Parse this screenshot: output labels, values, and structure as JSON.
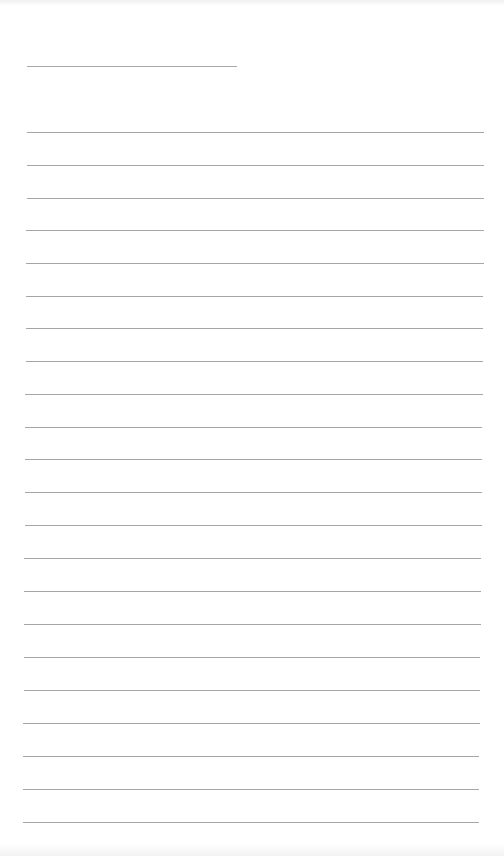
{
  "page": {
    "type": "lined-paper",
    "background_color": "#ffffff",
    "line_color": "#a6a6a6"
  },
  "name_line": {
    "x1": 27,
    "x2": 237,
    "y": 66
  },
  "ruled_lines": [
    {
      "y": 132,
      "x1": 27,
      "x2": 484
    },
    {
      "y": 165,
      "x1": 27,
      "x2": 484
    },
    {
      "y": 198,
      "x1": 27,
      "x2": 484
    },
    {
      "y": 230,
      "x1": 26,
      "x2": 484
    },
    {
      "y": 263,
      "x1": 26,
      "x2": 484
    },
    {
      "y": 296,
      "x1": 26,
      "x2": 483
    },
    {
      "y": 328,
      "x1": 26,
      "x2": 483
    },
    {
      "y": 361,
      "x1": 26,
      "x2": 483
    },
    {
      "y": 394,
      "x1": 25,
      "x2": 483
    },
    {
      "y": 427,
      "x1": 25,
      "x2": 482
    },
    {
      "y": 459,
      "x1": 25,
      "x2": 482
    },
    {
      "y": 492,
      "x1": 25,
      "x2": 482
    },
    {
      "y": 525,
      "x1": 25,
      "x2": 482
    },
    {
      "y": 558,
      "x1": 24,
      "x2": 481
    },
    {
      "y": 591,
      "x1": 24,
      "x2": 481
    },
    {
      "y": 624,
      "x1": 24,
      "x2": 481
    },
    {
      "y": 657,
      "x1": 24,
      "x2": 480
    },
    {
      "y": 690,
      "x1": 24,
      "x2": 480
    },
    {
      "y": 723,
      "x1": 23,
      "x2": 480
    },
    {
      "y": 756,
      "x1": 23,
      "x2": 479
    },
    {
      "y": 789,
      "x1": 23,
      "x2": 479
    },
    {
      "y": 822,
      "x1": 23,
      "x2": 479
    }
  ]
}
